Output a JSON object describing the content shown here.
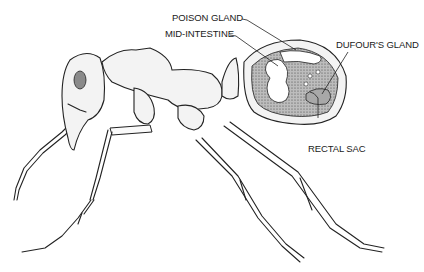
{
  "diagram": {
    "labels": [
      {
        "id": "poison-gland",
        "text": "POISON GLAND"
      },
      {
        "id": "mid-intestine",
        "text": "MID-INTESTINE"
      },
      {
        "id": "dufours-gland",
        "text": "DUFOUR'S GLAND"
      },
      {
        "id": "rectal-sac",
        "text": "RECTAL SAC"
      }
    ]
  }
}
